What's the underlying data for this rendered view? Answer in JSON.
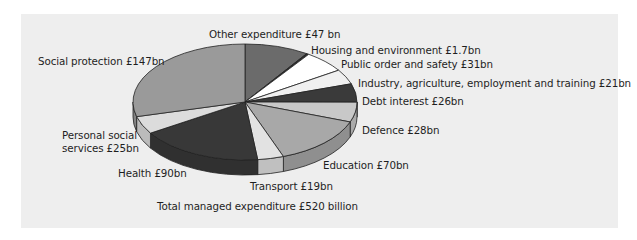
{
  "chart_data": {
    "type": "pie",
    "style": "3d-exploded-none",
    "title": "",
    "caption": "Total managed expenditure £520 billion",
    "total": 520,
    "unit": "£bn",
    "slices": [
      {
        "name": "Other expenditure",
        "label": "Other expenditure £47 bn",
        "value": 47,
        "color": "#6b6b6b"
      },
      {
        "name": "Housing and environment",
        "label": "Housing and environment £1.7bn",
        "value": 1.7,
        "color": "#2e2e2e"
      },
      {
        "name": "Public order and safety",
        "label": "Public order and safety £31bn",
        "value": 31,
        "color": "#ffffff"
      },
      {
        "name": "Industry, agriculture, employment and training",
        "label": "Industry, agriculture, employment and training £21bn",
        "value": 21,
        "color": "#f0f0f0"
      },
      {
        "name": "Debt interest",
        "label": "Debt interest £26bn",
        "value": 26,
        "color": "#3a3a3a"
      },
      {
        "name": "Defence",
        "label": "Defence £28bn",
        "value": 28,
        "color": "#c8c8c8"
      },
      {
        "name": "Education",
        "label": "Education £70bn",
        "value": 70,
        "color": "#a8a8a8"
      },
      {
        "name": "Transport",
        "label": "Transport £19bn",
        "value": 19,
        "color": "#e2e2e2"
      },
      {
        "name": "Health",
        "label": "Health £90bn",
        "value": 90,
        "color": "#383838"
      },
      {
        "name": "Personal social services",
        "label": "Personal social services £25bn",
        "value": 25,
        "color": "#dcdcdc"
      },
      {
        "name": "Social protection",
        "label": "Social protection £147bn",
        "value": 147,
        "color": "#9a9a9a"
      }
    ],
    "legend": "none (labels placed around pie)"
  },
  "labels": {
    "other": "Other expenditure £47 bn",
    "housing": "Housing and environment £1.7bn",
    "public_order": "Public order and safety £31bn",
    "industry": "Industry, agriculture, employment and training £21bn",
    "debt": "Debt interest £26bn",
    "defence": "Defence £28bn",
    "education": "Education £70bn",
    "transport": "Transport £19bn",
    "health": "Health £90bn",
    "personal_social_1": "Personal social",
    "personal_social_2": "services £25bn",
    "social_protection": "Social protection £147bn",
    "total": "Total managed expenditure £520 billion"
  }
}
